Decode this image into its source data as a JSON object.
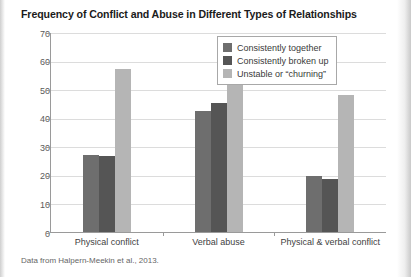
{
  "chart_data": {
    "type": "bar",
    "title": "Frequency of Conflict and Abuse in Different Types of Relationships",
    "xlabel": "",
    "ylabel": "",
    "ylim": [
      0,
      70
    ],
    "yticks": [
      0,
      10,
      20,
      30,
      40,
      50,
      60,
      70
    ],
    "ytick_labels": [
      "0",
      "10",
      "20",
      "30",
      "40",
      "50",
      "60",
      "70"
    ],
    "grid": true,
    "legend_position": "top-right-inside",
    "categories": [
      "Physical conflict",
      "Verbal abuse",
      "Physical & verbal conflict"
    ],
    "series": [
      {
        "name": "Consistently together",
        "color": "#6e6e6e",
        "values": [
          27,
          42.5,
          19.7
        ]
      },
      {
        "name": "Consistently broken up",
        "color": "#555555",
        "values": [
          26.5,
          45,
          18.5
        ]
      },
      {
        "name": "Unstable or “churning”",
        "color": "#b5b5b5",
        "values": [
          57,
          64,
          48
        ]
      }
    ],
    "source_note": "Data from Halpern-Meekin et al., 2013."
  },
  "colors": {
    "page_background": "#ffffff",
    "axis": "#9a9a9a",
    "gridline": "#dcdcdc",
    "title_text": "#1b1b1b",
    "tick_text": "#5a5a5a",
    "footnote_text": "#666666",
    "legend_border": "#a8a8a8"
  }
}
